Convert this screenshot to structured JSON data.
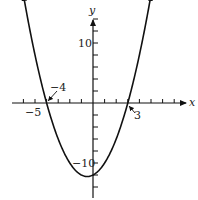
{
  "chart_data": {
    "type": "line",
    "title": "",
    "function": "y = (x + 4)(x - 3) = x^2 + x - 12",
    "xlabel": "x",
    "ylabel": "y",
    "x_range": [
      -7,
      7.5
    ],
    "y_range": [
      -14,
      16
    ],
    "x_tick_step": 1,
    "y_tick_step": 2,
    "grid": false,
    "legend": null,
    "labeled_ticks": {
      "x": [
        "-5"
      ],
      "y": [
        "10",
        "-10"
      ]
    },
    "annotations": [
      {
        "text": "-4",
        "point": [
          -4,
          0
        ],
        "note": "x-intercept with arrow"
      },
      {
        "text": "3",
        "point": [
          3,
          0
        ],
        "note": "x-intercept with arrow"
      }
    ],
    "roots": [
      -4,
      3
    ],
    "vertex": [
      -0.5,
      -12.25
    ],
    "y_intercept": -12,
    "points": [
      {
        "x": -6.2,
        "y": 20.24
      },
      {
        "x": -5,
        "y": 8
      },
      {
        "x": -4,
        "y": 0
      },
      {
        "x": -3,
        "y": -6
      },
      {
        "x": -2,
        "y": -10
      },
      {
        "x": -1,
        "y": -12
      },
      {
        "x": -0.5,
        "y": -12.25
      },
      {
        "x": 0,
        "y": -12
      },
      {
        "x": 1,
        "y": -10
      },
      {
        "x": 2,
        "y": -6
      },
      {
        "x": 3,
        "y": 0
      },
      {
        "x": 4,
        "y": 8
      },
      {
        "x": 5.2,
        "y": 20.24
      }
    ]
  },
  "labels": {
    "x_axis": "x",
    "y_axis": "y",
    "y_tick_10": "10",
    "y_tick_neg10": "−10",
    "x_tick_neg5": "−5",
    "root_left": "−4",
    "root_right": "3"
  }
}
